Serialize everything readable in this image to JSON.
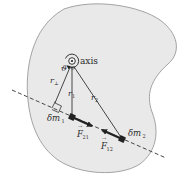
{
  "diagram": {
    "colors": {
      "body_fill": "#e9e9e9",
      "body_stroke": "#9a9a9a",
      "line": "#2f2f2f",
      "mass": "#222222",
      "text": "#2a2a2a"
    },
    "labels": {
      "axis": "axis",
      "angle": "ϑ",
      "r_perp": "r",
      "r_perp_sub": "⊥",
      "r1": "r",
      "r1_sub": "1",
      "r2": "r",
      "r2_sub": "2",
      "dm1": "δm",
      "dm1_sub": "1",
      "dm2": "δm",
      "dm2_sub": "2",
      "f21": "F",
      "f21_sub": "21",
      "f12": "F",
      "f12_sub": "12",
      "vector_arrow": "→"
    },
    "elements": {
      "axis_point": {
        "x": 72,
        "y": 61
      },
      "mass1": {
        "x": 72,
        "y": 117
      },
      "mass2": {
        "x": 122,
        "y": 139
      },
      "line_of_action": {
        "x1": 12,
        "y1": 90,
        "x2": 166,
        "y2": 158
      }
    }
  }
}
